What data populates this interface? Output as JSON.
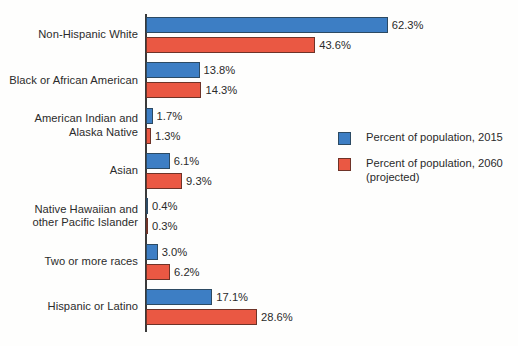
{
  "chart_data": {
    "type": "bar",
    "orientation": "horizontal",
    "title": "",
    "xlabel": "",
    "ylabel": "",
    "xlim": [
      0,
      70
    ],
    "grid": false,
    "legend_position": "center-right",
    "categories": [
      "Non-Hispanic White",
      "Black or African American",
      "American Indian and\nAlaska Native",
      "Asian",
      "Native Hawaiian and\nother Pacific Islander",
      "Two or more races",
      "Hispanic or Latino"
    ],
    "series": [
      {
        "name": "Percent of population, 2015",
        "color": "#3d7ec4",
        "values": [
          62.3,
          13.8,
          1.7,
          6.1,
          0.4,
          3.0,
          17.1
        ],
        "labels": [
          "62.3%",
          "13.8%",
          "1.7%",
          "6.1%",
          "0.4%",
          "3.0%",
          "17.1%"
        ]
      },
      {
        "name": "Percent of population, 2060\n(projected)",
        "color": "#ea5843",
        "values": [
          43.6,
          14.3,
          1.3,
          9.3,
          0.3,
          6.2,
          28.6
        ],
        "labels": [
          "43.6%",
          "14.3%",
          "1.3%",
          "9.3%",
          "0.3%",
          "6.2%",
          "28.6%"
        ]
      }
    ]
  },
  "legend": {
    "items": [
      {
        "label": "Percent of population, 2015",
        "color": "#3d7ec4"
      },
      {
        "label": "Percent of population, 2060\n(projected)",
        "color": "#ea5843"
      }
    ]
  },
  "colors": {
    "series_2015": "#3d7ec4",
    "series_2060": "#ea5843",
    "axis": "#3a3a3a",
    "text": "#2b2b2b",
    "background": "#fefefd"
  }
}
